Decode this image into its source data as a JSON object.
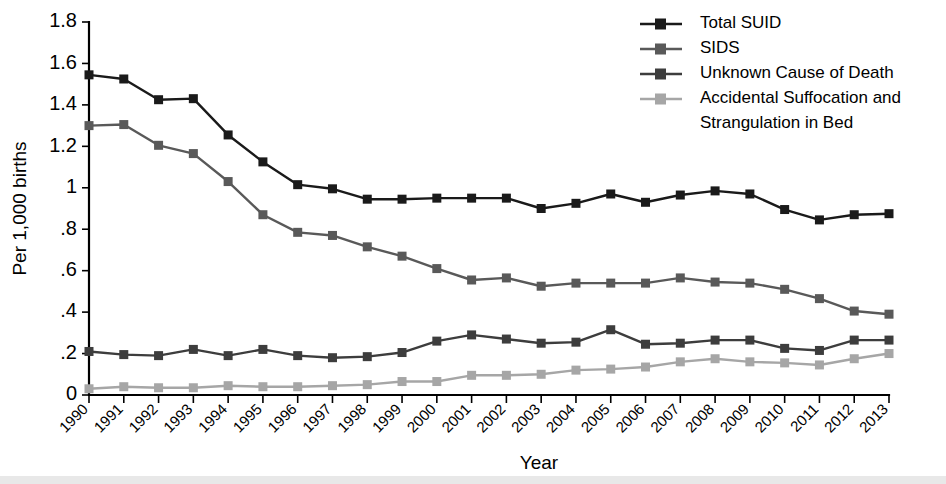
{
  "chart_data": {
    "type": "line",
    "title": "",
    "xlabel": "Year",
    "ylabel": "Per 1,000 births",
    "x": [
      1990,
      1991,
      1992,
      1993,
      1994,
      1995,
      1996,
      1997,
      1998,
      1999,
      2000,
      2001,
      2002,
      2003,
      2004,
      2005,
      2006,
      2007,
      2008,
      2009,
      2010,
      2011,
      2012,
      2013
    ],
    "categories": [
      "1990",
      "1991",
      "1992",
      "1993",
      "1994",
      "1995",
      "1996",
      "1997",
      "1998",
      "1999",
      "2000",
      "2001",
      "2002",
      "2003",
      "2004",
      "2005",
      "2006",
      "2007",
      "2008",
      "2009",
      "2010",
      "2011",
      "2012",
      "2013"
    ],
    "xlim": [
      1990,
      2013
    ],
    "ylim": [
      0,
      1.8
    ],
    "ytick_values": [
      0,
      0.2,
      0.4,
      0.6,
      0.8,
      1.0,
      1.2,
      1.4,
      1.6,
      1.8
    ],
    "ytick_labels": [
      "0",
      ".2",
      ".4",
      ".6",
      ".8",
      "1",
      "1.2",
      "1.4",
      "1.6",
      "1.8"
    ],
    "grid": false,
    "legend_position": "top-right",
    "marker": "square",
    "series": [
      {
        "name": "Total SUID",
        "color": "#1a1a1a",
        "values": [
          1.545,
          1.525,
          1.425,
          1.43,
          1.255,
          1.125,
          1.015,
          0.995,
          0.945,
          0.945,
          0.95,
          0.95,
          0.95,
          0.9,
          0.925,
          0.97,
          0.93,
          0.965,
          0.985,
          0.97,
          0.895,
          0.845,
          0.87,
          0.875
        ]
      },
      {
        "name": "SIDS",
        "color": "#595959",
        "values": [
          1.3,
          1.305,
          1.205,
          1.165,
          1.03,
          0.87,
          0.785,
          0.77,
          0.715,
          0.67,
          0.61,
          0.555,
          0.565,
          0.525,
          0.54,
          0.54,
          0.54,
          0.565,
          0.545,
          0.54,
          0.51,
          0.465,
          0.405,
          0.39
        ]
      },
      {
        "name": "Unknown Cause of Death",
        "color": "#3d3d3d",
        "values": [
          0.21,
          0.195,
          0.19,
          0.22,
          0.19,
          0.22,
          0.19,
          0.18,
          0.185,
          0.205,
          0.26,
          0.29,
          0.27,
          0.25,
          0.255,
          0.315,
          0.245,
          0.25,
          0.265,
          0.265,
          0.225,
          0.215,
          0.265,
          0.265
        ]
      },
      {
        "name": "Accidental Suffocation and Strangulation in Bed",
        "color": "#a6a6a6",
        "values": [
          0.03,
          0.04,
          0.035,
          0.035,
          0.045,
          0.04,
          0.04,
          0.045,
          0.05,
          0.065,
          0.065,
          0.095,
          0.095,
          0.1,
          0.12,
          0.125,
          0.135,
          0.16,
          0.175,
          0.16,
          0.155,
          0.145,
          0.175,
          0.2
        ]
      }
    ],
    "legend_entries": [
      {
        "label": "Total SUID",
        "color": "#1a1a1a"
      },
      {
        "label": "SIDS",
        "color": "#595959"
      },
      {
        "label": "Unknown Cause of Death",
        "color": "#3d3d3d"
      },
      {
        "label": "Accidental Suffocation and",
        "color": "#a6a6a6"
      },
      {
        "label": "Strangulation in Bed",
        "color": ""
      }
    ]
  }
}
